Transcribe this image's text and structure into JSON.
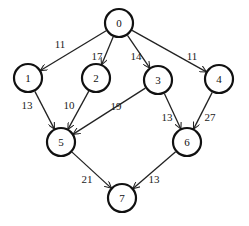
{
  "graph": {
    "directed": true,
    "nodes": [
      {
        "id": "0",
        "label": "0"
      },
      {
        "id": "1",
        "label": "1"
      },
      {
        "id": "2",
        "label": "2"
      },
      {
        "id": "3",
        "label": "3"
      },
      {
        "id": "4",
        "label": "4"
      },
      {
        "id": "5",
        "label": "5"
      },
      {
        "id": "6",
        "label": "6"
      },
      {
        "id": "7",
        "label": "7"
      }
    ],
    "edges": [
      {
        "from": "0",
        "to": "1",
        "weight": "11"
      },
      {
        "from": "0",
        "to": "2",
        "weight": "17"
      },
      {
        "from": "0",
        "to": "3",
        "weight": "14"
      },
      {
        "from": "0",
        "to": "4",
        "weight": "11"
      },
      {
        "from": "1",
        "to": "5",
        "weight": "13"
      },
      {
        "from": "2",
        "to": "5",
        "weight": "10"
      },
      {
        "from": "3",
        "to": "5",
        "weight": "19"
      },
      {
        "from": "3",
        "to": "6",
        "weight": "13"
      },
      {
        "from": "4",
        "to": "6",
        "weight": "27"
      },
      {
        "from": "5",
        "to": "7",
        "weight": "21"
      },
      {
        "from": "6",
        "to": "7",
        "weight": "13"
      }
    ]
  }
}
